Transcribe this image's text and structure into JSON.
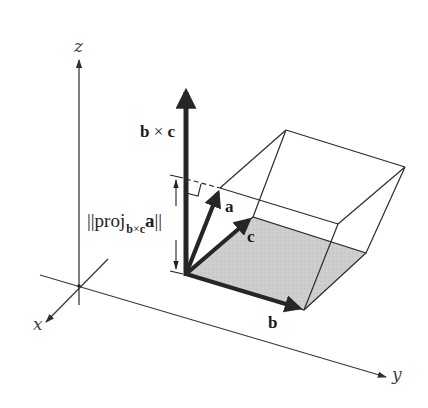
{
  "figure": {
    "type": "3d-vector-diagram",
    "axes": {
      "x_label": "x",
      "y_label": "y",
      "z_label": "z"
    },
    "vectors": {
      "a_label": "a",
      "b_label": "b",
      "c_label": "c",
      "cross_label_left": "b",
      "cross_label_op": "×",
      "cross_label_right": "c"
    },
    "projection": {
      "bars_open": "||",
      "word": "proj",
      "sub_left": "b",
      "sub_op": "×",
      "sub_right": "c",
      "vector": "a",
      "bars_close": "||"
    },
    "colors": {
      "ink": "#2b2b2b",
      "vector": "#262626",
      "base_face": "#cfcfcf",
      "axis": "#3a3a3a",
      "background": "#ffffff"
    }
  }
}
